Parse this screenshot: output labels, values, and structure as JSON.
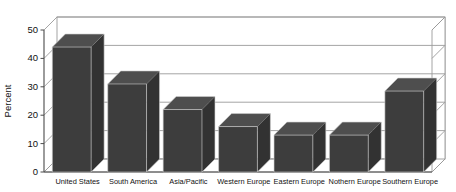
{
  "chart_data": {
    "type": "bar",
    "title": "",
    "xlabel": "",
    "ylabel": "Percent",
    "ylim": [
      0,
      50
    ],
    "yticks": [
      0,
      10,
      20,
      30,
      40,
      50
    ],
    "ytick_labels": [
      "0",
      "10",
      "20",
      "30",
      "40",
      "50"
    ],
    "grid": true,
    "legend": false,
    "three_d": true,
    "bar_color": "#3d3d3d",
    "background_color": "#ffffff",
    "grid_color": "#9a9a9a",
    "categories": [
      "United States",
      "South America",
      "Asia/Pacific",
      "Western Europe",
      "Eastern Europe",
      "Nothern Europe",
      "Southern Europe"
    ],
    "values": [
      44,
      31,
      22,
      16,
      13,
      13,
      28.5
    ],
    "series": [
      {
        "name": "Percent",
        "values": [
          44,
          31,
          22,
          16,
          13,
          13,
          28.5
        ]
      }
    ]
  }
}
